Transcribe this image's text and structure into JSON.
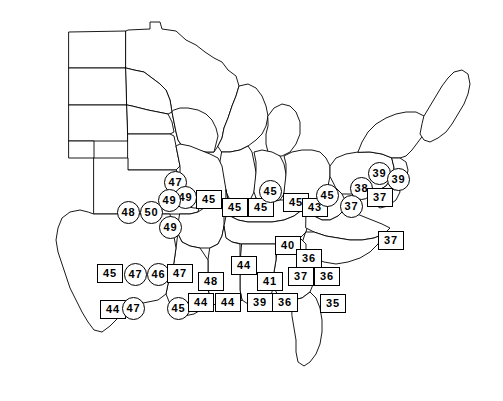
{
  "map": {
    "title": "United States regional value map",
    "label_shapes": {
      "box": "square",
      "circle": "circle"
    },
    "colors": {
      "outline": "#000000",
      "fill": "#ffffff",
      "label_text": "#000000"
    },
    "labels": [
      {
        "value": "47",
        "shape": "circle",
        "x": 164,
        "y": 171
      },
      {
        "value": "49",
        "shape": "circle",
        "x": 174,
        "y": 186
      },
      {
        "value": "49",
        "shape": "circle",
        "x": 158,
        "y": 189
      },
      {
        "value": "48",
        "shape": "circle",
        "x": 117,
        "y": 201
      },
      {
        "value": "50",
        "shape": "circle",
        "x": 140,
        "y": 201
      },
      {
        "value": "49",
        "shape": "circle",
        "x": 159,
        "y": 216
      },
      {
        "value": "45",
        "shape": "box",
        "x": 196,
        "y": 190
      },
      {
        "value": "45",
        "shape": "box",
        "x": 222,
        "y": 198
      },
      {
        "value": "45",
        "shape": "box",
        "x": 248,
        "y": 198
      },
      {
        "value": "45",
        "shape": "circle",
        "x": 259,
        "y": 180
      },
      {
        "value": "45",
        "shape": "box",
        "x": 283,
        "y": 193
      },
      {
        "value": "43",
        "shape": "box",
        "x": 302,
        "y": 198
      },
      {
        "value": "45",
        "shape": "circle",
        "x": 316,
        "y": 184
      },
      {
        "value": "38",
        "shape": "circle",
        "x": 350,
        "y": 177
      },
      {
        "value": "37",
        "shape": "circle",
        "x": 340,
        "y": 195
      },
      {
        "value": "39",
        "shape": "circle",
        "x": 368,
        "y": 162
      },
      {
        "value": "39",
        "shape": "circle",
        "x": 387,
        "y": 168
      },
      {
        "value": "37",
        "shape": "box",
        "x": 367,
        "y": 188
      },
      {
        "value": "37",
        "shape": "box",
        "x": 378,
        "y": 231
      },
      {
        "value": "40",
        "shape": "box",
        "x": 275,
        "y": 236
      },
      {
        "value": "36",
        "shape": "box",
        "x": 296,
        "y": 249
      },
      {
        "value": "37",
        "shape": "box",
        "x": 288,
        "y": 267
      },
      {
        "value": "36",
        "shape": "box",
        "x": 314,
        "y": 267
      },
      {
        "value": "35",
        "shape": "box",
        "x": 320,
        "y": 294
      },
      {
        "value": "44",
        "shape": "box",
        "x": 231,
        "y": 256
      },
      {
        "value": "41",
        "shape": "box",
        "x": 257,
        "y": 272
      },
      {
        "value": "48",
        "shape": "box",
        "x": 198,
        "y": 272
      },
      {
        "value": "45",
        "shape": "box",
        "x": 97,
        "y": 264
      },
      {
        "value": "47",
        "shape": "circle",
        "x": 124,
        "y": 263
      },
      {
        "value": "46",
        "shape": "circle",
        "x": 147,
        "y": 263
      },
      {
        "value": "47",
        "shape": "box",
        "x": 167,
        "y": 264
      },
      {
        "value": "44",
        "shape": "box",
        "x": 100,
        "y": 300
      },
      {
        "value": "47",
        "shape": "circle",
        "x": 122,
        "y": 297
      },
      {
        "value": "45",
        "shape": "circle",
        "x": 167,
        "y": 297
      },
      {
        "value": "44",
        "shape": "box",
        "x": 188,
        "y": 293
      },
      {
        "value": "44",
        "shape": "box",
        "x": 215,
        "y": 293
      },
      {
        "value": "39",
        "shape": "box",
        "x": 247,
        "y": 293
      },
      {
        "value": "36",
        "shape": "box",
        "x": 272,
        "y": 293
      }
    ]
  }
}
